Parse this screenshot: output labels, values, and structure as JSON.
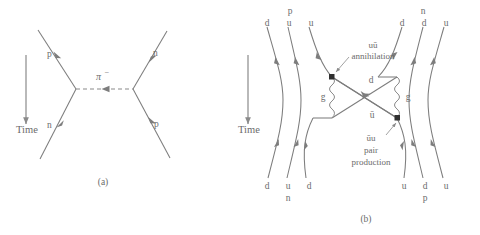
{
  "figure": {
    "panels": [
      {
        "id": "a",
        "caption": "(a)",
        "time_label": "Time",
        "time_direction": "downward",
        "exchange_particle": "π−",
        "exchange_particle_display": "π",
        "exchange_superscript": "−",
        "exchange_line_style": "dashed",
        "exchange_arrow_direction": "leftward",
        "incoming": [
          {
            "name": "proton-in",
            "label": "p",
            "position": "upper-left"
          },
          {
            "name": "neutron-in",
            "label": "n",
            "position": "lower-left"
          }
        ],
        "outgoing": [
          {
            "name": "neutron-out",
            "label": "n",
            "position": "upper-right"
          },
          {
            "name": "proton-out",
            "label": "p",
            "position": "lower-right"
          }
        ]
      },
      {
        "id": "b",
        "caption": "(b)",
        "time_label": "Time",
        "time_direction": "downward",
        "top_left_hadron": "p",
        "top_left_quarks": [
          "d",
          "u",
          "u"
        ],
        "top_right_hadron": "n",
        "top_right_quarks": [
          "d",
          "d",
          "u"
        ],
        "bottom_left_quarks": [
          "d",
          "u",
          "d"
        ],
        "bottom_left_hadron": "n",
        "bottom_right_quarks": [
          "u",
          "d",
          "u"
        ],
        "bottom_right_hadron": "p",
        "annotations": [
          {
            "name": "annihilation-annotation",
            "lines": [
              "uū",
              "annihilation"
            ],
            "points_to": "upper-vertex"
          },
          {
            "name": "pair-production-annotation",
            "lines": [
              "ūu",
              "pair",
              "production"
            ],
            "points_to": "lower-vertex"
          }
        ],
        "exchange_quarks": [
          {
            "name": "d-quark-label",
            "label": "d",
            "position": "above-crossing"
          },
          {
            "name": "antiu-quark-label",
            "label": "ū",
            "position": "below-crossing"
          }
        ],
        "gluons": [
          {
            "name": "gluon-left",
            "label": "g"
          },
          {
            "name": "gluon-right",
            "label": "g"
          }
        ]
      }
    ]
  },
  "colors": {
    "line": "#7d7d7d",
    "text": "#6b6b6b",
    "vertex_dot": "#2f2f2f",
    "background": "#ffffff"
  }
}
